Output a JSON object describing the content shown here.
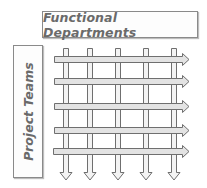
{
  "diagram": {
    "type": "matrix-organization",
    "header": {
      "label": "Functional Departments"
    },
    "side": {
      "label": "Project Teams"
    },
    "vertical_arrows": {
      "count": 5,
      "direction": "down",
      "represents": "Functional Departments"
    },
    "horizontal_arrows": {
      "count": 5,
      "direction": "right",
      "represents": "Project Teams"
    },
    "colors": {
      "outline": "#6f6f6f",
      "arrow_fill": "#e6e6e6",
      "text": "#6a6a6a"
    }
  }
}
